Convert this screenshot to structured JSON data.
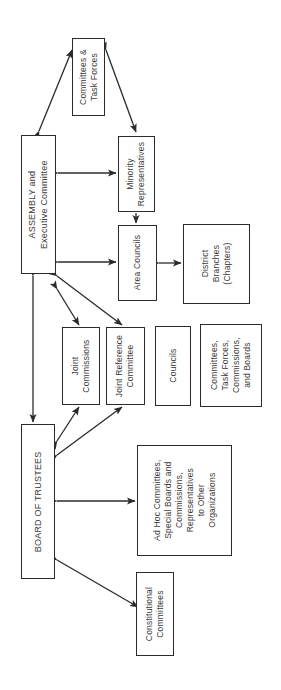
{
  "diagram": {
    "orientation": "rotated-90-ccw",
    "background_color": "#ffffff",
    "line_color": "#2b2b2b",
    "text_color": "#3a3a3a",
    "nodes": [
      {
        "id": "committees_task_forces",
        "lines": [
          "Committees &",
          "Task Forces"
        ],
        "x": 72,
        "y": 38,
        "w": 33,
        "h": 78,
        "font": "s85"
      },
      {
        "id": "assembly",
        "lines": [
          "ASSEMBLY and",
          "Executive Committee"
        ],
        "x": 21,
        "y": 135,
        "w": 35,
        "h": 139,
        "font": "s9"
      },
      {
        "id": "minority_representatives",
        "lines": [
          "Minority",
          "Representatives"
        ],
        "x": 118,
        "y": 136,
        "w": 37,
        "h": 76,
        "font": "s85"
      },
      {
        "id": "area_councils",
        "lines": [
          "Area Councils"
        ],
        "x": 118,
        "y": 225,
        "w": 39,
        "h": 76,
        "font": "s85"
      },
      {
        "id": "district_branches",
        "lines": [
          "District",
          "Branches",
          "(Chapters)"
        ],
        "x": 183,
        "y": 224,
        "w": 67,
        "h": 80,
        "font": "s85"
      },
      {
        "id": "joint_commissions",
        "lines": [
          "Joint",
          "Commissions"
        ],
        "x": 62,
        "y": 327,
        "w": 38,
        "h": 78,
        "font": "s85"
      },
      {
        "id": "joint_reference_committee",
        "lines": [
          "Joint Reference",
          "Committee"
        ],
        "x": 106,
        "y": 327,
        "w": 39,
        "h": 78,
        "font": "s85"
      },
      {
        "id": "councils",
        "lines": [
          "Councils"
        ],
        "x": 155,
        "y": 326,
        "w": 36,
        "h": 80,
        "font": "s85"
      },
      {
        "id": "committees_task_forces_commissions_boards",
        "lines": [
          "Committees,",
          "Task Forces,",
          "Commissions,",
          "and Boards"
        ],
        "x": 200,
        "y": 324,
        "w": 62,
        "h": 83,
        "font": "s85"
      },
      {
        "id": "board_of_trustees",
        "lines": [
          "BOARD OF TRUSTEES"
        ],
        "x": 21,
        "y": 424,
        "w": 34,
        "h": 155,
        "font": "s9"
      },
      {
        "id": "ad_hoc_committees",
        "lines": [
          "Ad Hoc Committees,",
          "Special Boards and",
          "Commissions,",
          "Representatives",
          "to Other",
          "Organizations"
        ],
        "x": 137,
        "y": 445,
        "w": 95,
        "h": 111,
        "font": "s85"
      },
      {
        "id": "constitutional_committees",
        "lines": [
          "Constitutional",
          "Committees"
        ],
        "x": 136,
        "y": 572,
        "w": 38,
        "h": 84,
        "font": "s85"
      }
    ],
    "connectors": [
      {
        "id": "assembly-committees-task-forces",
        "type": "double-arrow-diagonal",
        "from": "assembly",
        "to": "committees_task_forces"
      },
      {
        "id": "committees-task-forces-minority",
        "type": "double-arrow-diagonal",
        "from": "committees_task_forces",
        "to": "minority_representatives"
      },
      {
        "id": "assembly-minority",
        "type": "double-arrow-horizontal",
        "from": "assembly",
        "to": "minority_representatives"
      },
      {
        "id": "minority-area-councils",
        "type": "single-arrow-vertical",
        "from": "minority_representatives",
        "to": "area_councils"
      },
      {
        "id": "assembly-area-councils",
        "type": "double-arrow-horizontal",
        "from": "assembly",
        "to": "area_councils"
      },
      {
        "id": "area-councils-district-branches",
        "type": "double-arrow-horizontal",
        "from": "area_councils",
        "to": "district_branches"
      },
      {
        "id": "assembly-joint-commissions",
        "type": "double-arrow-diagonal",
        "from": "assembly",
        "to": "joint_commissions"
      },
      {
        "id": "assembly-joint-reference-committee",
        "type": "double-arrow-diagonal",
        "from": "assembly",
        "to": "joint_reference_committee"
      },
      {
        "id": "assembly-board-of-trustees",
        "type": "double-arrow-vertical",
        "from": "assembly",
        "to": "board_of_trustees"
      },
      {
        "id": "board-joint-commissions",
        "type": "double-arrow-diagonal",
        "from": "board_of_trustees",
        "to": "joint_commissions"
      },
      {
        "id": "board-joint-reference-committee",
        "type": "double-arrow-diagonal",
        "from": "board_of_trustees",
        "to": "joint_reference_committee"
      },
      {
        "id": "board-ad-hoc",
        "type": "double-arrow-horizontal",
        "from": "board_of_trustees",
        "to": "ad_hoc_committees"
      },
      {
        "id": "board-constitutional-committees",
        "type": "double-arrow-diagonal",
        "from": "board_of_trustees",
        "to": "constitutional_committees"
      }
    ]
  }
}
